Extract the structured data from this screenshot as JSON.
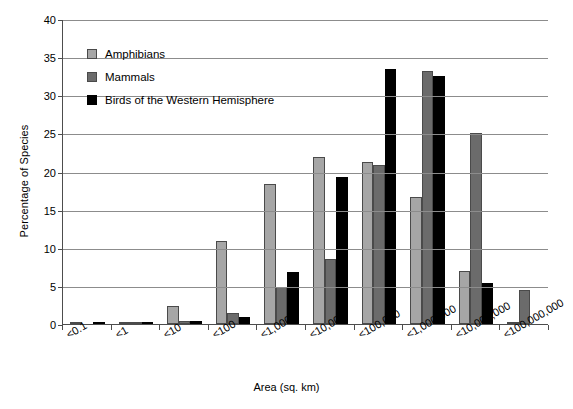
{
  "chart_data": {
    "type": "bar",
    "title": "",
    "xlabel": "Area (sq. km)",
    "ylabel": "Percentage of Species",
    "ylim": [
      0,
      40
    ],
    "yticks": [
      0,
      5,
      10,
      15,
      20,
      25,
      30,
      35,
      40
    ],
    "grid": true,
    "legend_position": "upper-left-inside",
    "categories": [
      "<0.1",
      "<1",
      "<10",
      "<100",
      "<1,000",
      "<10,000",
      "<100,000",
      "<1,000,000",
      "<10,000,000",
      "<100,000,000"
    ],
    "series": [
      {
        "name": "Amphibians",
        "color": "#a6a6a6",
        "values": [
          0.1,
          0.1,
          2.4,
          10.9,
          18.4,
          21.9,
          21.3,
          16.7,
          7.0,
          0.2
        ]
      },
      {
        "name": "Mammals",
        "color": "#6b6b6b",
        "values": [
          0.0,
          0.1,
          0.4,
          1.4,
          4.9,
          8.5,
          20.8,
          33.2,
          25.0,
          4.5
        ]
      },
      {
        "name": "Birds of the Western Hemisphere",
        "color": "#000000",
        "values": [
          0.1,
          0.1,
          0.4,
          0.9,
          6.8,
          19.3,
          33.5,
          32.5,
          5.4,
          0.0
        ]
      }
    ]
  },
  "axes": {
    "y_title": "Percentage of Species",
    "x_title": "Area (sq. km)"
  }
}
